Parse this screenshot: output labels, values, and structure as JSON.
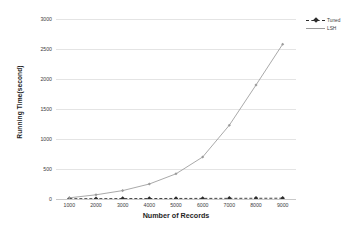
{
  "chart_data": {
    "type": "line",
    "title": "",
    "xlabel": "Number of Records",
    "ylabel": "Running Time(second)",
    "categories": [
      1000,
      2000,
      3000,
      4000,
      5000,
      6000,
      7000,
      8000,
      9000
    ],
    "x_tick_labels": [
      "1000",
      "2000",
      "3000",
      "4000",
      "5000",
      "6000",
      "7000",
      "8000",
      "9000"
    ],
    "y_tick_labels": [
      "0",
      "500",
      "1000",
      "1500",
      "2000",
      "2500",
      "3000"
    ],
    "y_ticks": [
      0,
      500,
      1000,
      1500,
      2000,
      2500,
      3000
    ],
    "ylim": [
      0,
      3000
    ],
    "grid": "horizontal",
    "legend_position": "top-right",
    "series": [
      {
        "name": "Tuned",
        "values": [
          5,
          6,
          7,
          8,
          9,
          10,
          11,
          12,
          13
        ],
        "color": "#2d2d2d",
        "line_style": "dashed",
        "marker": "diamond"
      },
      {
        "name": "LSH",
        "values": [
          20,
          70,
          140,
          250,
          420,
          700,
          1230,
          1900,
          2580
        ],
        "color": "#9a9a9a",
        "line_style": "solid",
        "marker": "diamond"
      }
    ]
  },
  "legend": {
    "items": [
      {
        "label": "Tuned"
      },
      {
        "label": "LSH"
      }
    ]
  },
  "axes": {
    "x_title": "Number of Records",
    "y_title": "Running Time(second)"
  },
  "colors": {
    "background": "#ffffff",
    "gridline": "#e4e4e4",
    "axis_text": "#3d3d3d",
    "series_tuned": "#2d2d2d",
    "series_lsh": "#9a9a9a"
  }
}
